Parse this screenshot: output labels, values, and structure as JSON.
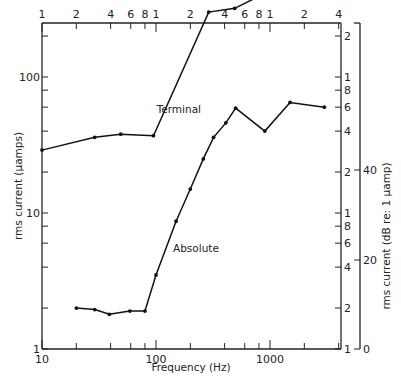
{
  "chart_data": {
    "type": "line",
    "title": "",
    "xlabel": "Frequency (Hz)",
    "ylabel": "rms current (μamps)",
    "ylabel_right": "rms current (dB re: 1 μamp)",
    "x_scale": "log",
    "y_scale": "log",
    "xlim": [
      10,
      4000
    ],
    "ylim": [
      1,
      600
    ],
    "grid": false,
    "legend": "none (inline annotations)",
    "x_ticks_bottom": [
      {
        "value": 10,
        "label": "10"
      },
      {
        "value": 20,
        "label": ""
      },
      {
        "value": 40,
        "label": ""
      },
      {
        "value": 60,
        "label": ""
      },
      {
        "value": 80,
        "label": ""
      },
      {
        "value": 100,
        "label": "100"
      },
      {
        "value": 200,
        "label": ""
      },
      {
        "value": 400,
        "label": ""
      },
      {
        "value": 600,
        "label": ""
      },
      {
        "value": 800,
        "label": ""
      },
      {
        "value": 1000,
        "label": "1000"
      },
      {
        "value": 2000,
        "label": ""
      },
      {
        "value": 4000,
        "label": ""
      }
    ],
    "x_ticks_top": [
      {
        "value": 10,
        "label": "1"
      },
      {
        "value": 20,
        "label": "2"
      },
      {
        "value": 40,
        "label": "4"
      },
      {
        "value": 60,
        "label": "6"
      },
      {
        "value": 80,
        "label": "8"
      },
      {
        "value": 100,
        "label": "1"
      },
      {
        "value": 200,
        "label": "2"
      },
      {
        "value": 400,
        "label": "4"
      },
      {
        "value": 600,
        "label": "6"
      },
      {
        "value": 800,
        "label": "8"
      },
      {
        "value": 1000,
        "label": "1"
      },
      {
        "value": 2000,
        "label": "2"
      },
      {
        "value": 4000,
        "label": "4"
      }
    ],
    "y_ticks_left": [
      {
        "value": 1,
        "label": "1"
      },
      {
        "value": 2,
        "label": ""
      },
      {
        "value": 4,
        "label": ""
      },
      {
        "value": 6,
        "label": ""
      },
      {
        "value": 8,
        "label": ""
      },
      {
        "value": 10,
        "label": "10"
      },
      {
        "value": 20,
        "label": ""
      },
      {
        "value": 40,
        "label": ""
      },
      {
        "value": 60,
        "label": ""
      },
      {
        "value": 80,
        "label": ""
      },
      {
        "value": 100,
        "label": "100"
      },
      {
        "value": 200,
        "label": ""
      },
      {
        "value": 400,
        "label": ""
      }
    ],
    "y_ticks_right_log": [
      {
        "value": 1,
        "label": "1"
      },
      {
        "value": 2,
        "label": "2"
      },
      {
        "value": 4,
        "label": "4"
      },
      {
        "value": 6,
        "label": "6"
      },
      {
        "value": 8,
        "label": "8"
      },
      {
        "value": 10,
        "label": "1"
      },
      {
        "value": 20,
        "label": "2"
      },
      {
        "value": 40,
        "label": "4"
      },
      {
        "value": 60,
        "label": "6"
      },
      {
        "value": 80,
        "label": "8"
      },
      {
        "value": 100,
        "label": "1"
      },
      {
        "value": 200,
        "label": "2"
      },
      {
        "value": 400,
        "label": "4"
      },
      {
        "value": 600,
        "label": "6"
      }
    ],
    "y_ticks_db": [
      {
        "py": 349,
        "label": "0"
      },
      {
        "py": 260,
        "label": "20"
      },
      {
        "py": 170,
        "label": "40"
      }
    ],
    "series": [
      {
        "name": "Terminal",
        "x": [
          10,
          29,
          49,
          95,
          290,
          490,
          1000
        ],
        "y": [
          29,
          36,
          38,
          37,
          300,
          320,
          430
        ]
      },
      {
        "name": "Absolute",
        "x": [
          20,
          29,
          39,
          59,
          80,
          100,
          150,
          200,
          260,
          320,
          410,
          500,
          900,
          1500,
          3000
        ],
        "y": [
          2.0,
          1.95,
          1.8,
          1.9,
          1.9,
          3.5,
          8.7,
          15,
          25,
          36,
          46,
          59,
          40,
          65,
          60
        ]
      }
    ],
    "annotations": [
      {
        "text": "Terminal",
        "x_px": 201,
        "y_px": 113
      },
      {
        "text": "Absolute",
        "x_px": 173,
        "y_px": 252
      }
    ]
  }
}
